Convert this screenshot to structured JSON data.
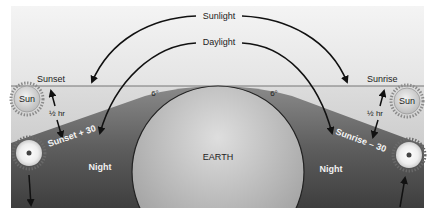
{
  "diagram": {
    "labels": {
      "sunlight": "Sunlight",
      "daylight": "Daylight",
      "sunset": "Sunset",
      "sunrise": "Sunrise",
      "sun_left": "Sun",
      "sun_right": "Sun",
      "half_hr_left": "½ hr",
      "half_hr_right": "½ hr",
      "angle_left": "6°",
      "angle_right": "6°",
      "sunset_plus": "Sunset + 30",
      "sunrise_minus": "Sunrise – 30",
      "night_left": "Night",
      "night_right": "Night",
      "earth": "EARTH"
    },
    "colors": {
      "sky_top": "#f2f2f2",
      "sky_bottom": "#e2e2e2",
      "twilight_light": "#c4c4c4",
      "night_dark": "#4a4a4a",
      "earth_light": "#d8d8d8",
      "earth_dark": "#9a9a9a",
      "sun_fill": "#e6e6e6",
      "line": "#111111"
    }
  }
}
